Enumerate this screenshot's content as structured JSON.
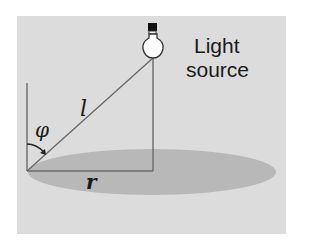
{
  "diagram": {
    "type": "geometry-illustration",
    "colors": {
      "background": "#ffffff",
      "panel": "#dcdcdc",
      "ellipse": "#b8b8b8",
      "lines": "#6a6a6a",
      "bulb_base": "#111111",
      "bulb_glass": "#ffffff"
    },
    "labels": {
      "light_source_line1": "Light",
      "light_source_line2": "source",
      "hypotenuse": "l",
      "angle": "φ",
      "base": "r"
    },
    "icons": {
      "light_bulb": "light-bulb-icon",
      "angle_arrow": "curved-arrow-icon"
    }
  }
}
